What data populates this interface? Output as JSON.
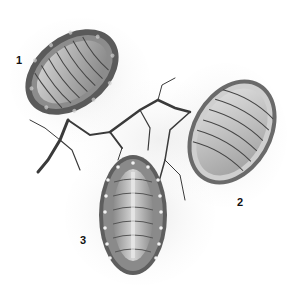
{
  "illustration": {
    "subject": "three chitons on cracked rock",
    "labels": [
      {
        "id": "1",
        "text": "1"
      },
      {
        "id": "2",
        "text": "2"
      },
      {
        "id": "3",
        "text": "3"
      }
    ],
    "colors": {
      "background": "#ffffff",
      "rock_shadow": "#d8d8d8",
      "crack": "#3a3a3a",
      "girdle_dark": "#5a5a5a",
      "plate_light": "#c9c9c9",
      "plate_mid": "#9a9a9a",
      "spicule": "#f2f2f2"
    }
  }
}
